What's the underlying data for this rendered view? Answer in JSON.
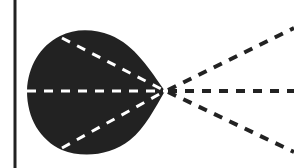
{
  "diagram": {
    "type": "ray-diagram",
    "width": 294,
    "height": 168,
    "colors": {
      "background": "#ffffff",
      "ink": "#222222",
      "inner_dash": "#ffffff"
    },
    "wall_line": {
      "x": 15,
      "y1": 0,
      "y2": 168
    },
    "blob": {
      "fill": "#222222",
      "path": "M165,91 C150,70 135,45 110,35 C95,29 75,28 60,36 C40,46 28,66 27,91 C27,118 40,140 62,150 C82,158 110,156 130,140 C145,128 155,108 165,91 Z"
    },
    "focal_point": {
      "x": 165,
      "y": 91
    },
    "inner_rays": [
      {
        "x1": 62,
        "y1": 38,
        "x2": 165,
        "y2": 91
      },
      {
        "x1": 27,
        "y1": 91,
        "x2": 165,
        "y2": 91
      },
      {
        "x1": 62,
        "y1": 148,
        "x2": 165,
        "y2": 91
      }
    ],
    "outer_rays": [
      {
        "x1": 168,
        "y1": 90,
        "x2": 294,
        "y2": 28
      },
      {
        "x1": 168,
        "y1": 91,
        "x2": 294,
        "y2": 91
      },
      {
        "x1": 168,
        "y1": 92,
        "x2": 294,
        "y2": 152
      }
    ],
    "dash_pattern": "9 8"
  }
}
